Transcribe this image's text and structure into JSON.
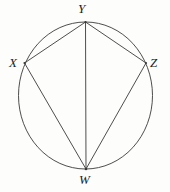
{
  "figure": {
    "name": "cyclic-quadrilateral-wxyz",
    "background_color": "#fdfdfc",
    "stroke_color": "#3a3a3a",
    "label_color": "#232323",
    "stroke_width": 0.9
  },
  "circle": {
    "name": "circumscribed-circle",
    "cx": 85.5,
    "cy": 95.5,
    "rx": 67,
    "ry": 73.5
  },
  "vertices": [
    {
      "id": "Y",
      "label": "Y",
      "x": 85.5,
      "y": 22,
      "label_x": 78,
      "label_y": 2
    },
    {
      "id": "X",
      "label": "X",
      "x": 24.5,
      "y": 63,
      "label_x": 9,
      "label_y": 56
    },
    {
      "id": "Z",
      "label": "Z",
      "x": 146,
      "y": 63,
      "label_x": 150,
      "label_y": 56
    },
    {
      "id": "W",
      "label": "W",
      "x": 86,
      "y": 169,
      "label_x": 79,
      "label_y": 173
    }
  ],
  "segments": [
    {
      "id": "XY",
      "from": "X",
      "to": "Y",
      "role": "chord-side"
    },
    {
      "id": "YZ",
      "from": "Y",
      "to": "Z",
      "role": "chord-side"
    },
    {
      "id": "XW",
      "from": "X",
      "to": "W",
      "role": "chord-diagonal"
    },
    {
      "id": "ZW",
      "from": "Z",
      "to": "W",
      "role": "chord-diagonal"
    },
    {
      "id": "YW",
      "from": "Y",
      "to": "W",
      "role": "chord-diagonal"
    }
  ],
  "labels": {
    "Y": "Y",
    "X": "X",
    "Z": "Z",
    "W": "W"
  }
}
